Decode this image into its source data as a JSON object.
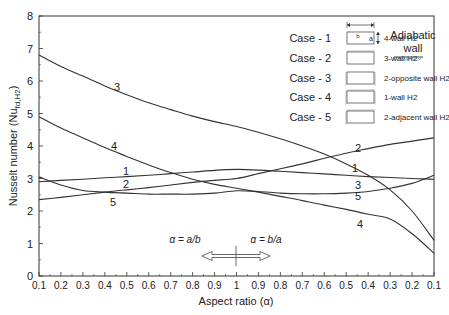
{
  "chart_data": {
    "type": "line",
    "title": "",
    "xlabel": "Aspect ratio (α)",
    "ylabel": "Nusselt number (Nu",
    "ylabel_sub": "fd,H2",
    "ylabel_close": ")",
    "x_ticks": [
      "0.1",
      "0.2",
      "0.3",
      "0.4",
      "0.5",
      "0.6",
      "0.7",
      "0.8",
      "0.9",
      "1",
      "0.9",
      "0.8",
      "0.7",
      "0.6",
      "0.5",
      "0.4",
      "0.3",
      "0.2",
      "0.1"
    ],
    "y_ticks": [
      "0",
      "1",
      "2",
      "3",
      "4",
      "5",
      "6",
      "7",
      "8"
    ],
    "ylim": [
      0,
      8
    ],
    "grid": false,
    "series": [
      {
        "name": "Case - 1",
        "label": "1",
        "description": "4-wall H2",
        "values": [
          2.9,
          2.94,
          2.98,
          3.02,
          3.06,
          3.1,
          3.15,
          3.2,
          3.25,
          3.28,
          3.26,
          3.22,
          3.18,
          3.14,
          3.1,
          3.06,
          3.03,
          3.0,
          2.98
        ]
      },
      {
        "name": "Case - 2",
        "label": "2",
        "description": "3-wall H2",
        "values": [
          2.35,
          2.42,
          2.5,
          2.58,
          2.65,
          2.72,
          2.8,
          2.88,
          2.94,
          3.0,
          3.15,
          3.3,
          3.45,
          3.62,
          3.78,
          3.92,
          4.05,
          4.15,
          4.25
        ]
      },
      {
        "name": "Case - 3",
        "label": "3",
        "description": "2-opposite wall H2",
        "values": [
          6.8,
          6.45,
          6.15,
          5.85,
          5.58,
          5.33,
          5.12,
          4.92,
          4.75,
          4.6,
          4.42,
          4.22,
          4.0,
          3.75,
          3.45,
          3.1,
          2.65,
          2.0,
          1.1
        ]
      },
      {
        "name": "Case - 4",
        "label": "4",
        "description": "1-wall H2",
        "values": [
          4.9,
          4.55,
          4.25,
          3.95,
          3.68,
          3.42,
          3.18,
          2.98,
          2.82,
          2.7,
          2.58,
          2.45,
          2.32,
          2.18,
          2.05,
          1.9,
          1.75,
          1.3,
          0.7
        ]
      },
      {
        "name": "Case - 5",
        "label": "5",
        "description": "2-adjacent wall H2",
        "values": [
          3.05,
          2.8,
          2.63,
          2.58,
          2.55,
          2.52,
          2.52,
          2.52,
          2.55,
          2.62,
          2.6,
          2.55,
          2.53,
          2.53,
          2.55,
          2.6,
          2.7,
          2.85,
          3.1
        ]
      }
    ],
    "legend_position": "top-right",
    "annotations": [
      "α = a/b",
      "α = b/a",
      "Adiabatic wall"
    ]
  },
  "legend": {
    "cases": [
      {
        "case": "Case - 1",
        "desc": "4-wall H2"
      },
      {
        "case": "Case - 2",
        "desc": "3-wall H2"
      },
      {
        "case": "Case - 3",
        "desc": "2-opposite wall H2"
      },
      {
        "case": "Case - 4",
        "desc": "1-wall H2"
      },
      {
        "case": "Case - 5",
        "desc": "2-adjacent wall H2"
      }
    ],
    "dim_b": "b",
    "dim_a": "a",
    "adiabatic_line1": "Adiabatic",
    "adiabatic_line2": "wall"
  },
  "annotations": {
    "left_ratio": "α = a/b",
    "right_ratio": "α = b/a"
  },
  "colors": {
    "line": "#333333",
    "axis": "#333333",
    "hatch": "#777777"
  }
}
